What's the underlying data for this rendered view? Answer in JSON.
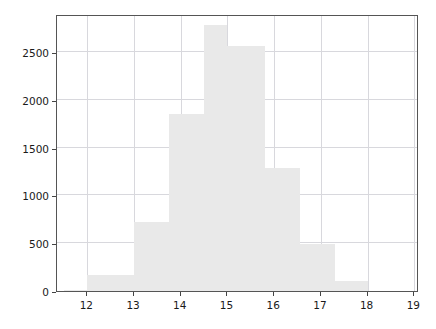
{
  "chart_data": {
    "type": "bar",
    "title": "",
    "xlabel": "",
    "ylabel": "",
    "subtitle": "",
    "grid": true,
    "legend": null,
    "bar_color": "#e9e9e9",
    "axis_color": "#555555",
    "grid_color": "#d8d8dd",
    "histogram": true,
    "bin_width": 0.5,
    "bin_edges": [
      11.5,
      12.0,
      12.5,
      13.0,
      13.5,
      14.0,
      14.5,
      15.0,
      15.5,
      16.0,
      16.5,
      17.0,
      17.5,
      18.0
    ],
    "bin_centers": [
      11.75,
      12.25,
      12.75,
      13.25,
      13.75,
      14.25,
      14.75,
      15.25,
      15.75,
      16.25,
      16.75,
      17.25,
      17.75
    ],
    "values": [
      15,
      165,
      165,
      720,
      720,
      1850,
      2780,
      2570,
      2570,
      1290,
      1290,
      490,
      100
    ],
    "bars": [
      {
        "x0": 11.5,
        "x1": 12.0,
        "value": 15
      },
      {
        "x0": 12.0,
        "x1": 13.0,
        "value": 165
      },
      {
        "x0": 13.0,
        "x1": 13.75,
        "value": 720
      },
      {
        "x0": 13.75,
        "x1": 14.5,
        "value": 1850
      },
      {
        "x0": 14.5,
        "x1": 15.0,
        "value": 2780
      },
      {
        "x0": 15.0,
        "x1": 15.8,
        "value": 2570
      },
      {
        "x0": 15.8,
        "x1": 16.55,
        "value": 1290
      },
      {
        "x0": 16.55,
        "x1": 17.3,
        "value": 490
      },
      {
        "x0": 17.3,
        "x1": 18.0,
        "value": 100
      }
    ],
    "xlim": [
      11.35,
      19.1
    ],
    "ylim": [
      0,
      2900
    ],
    "xticks": [
      12,
      13,
      14,
      15,
      16,
      17,
      18,
      19
    ],
    "xticklabels": [
      "12",
      "13",
      "14",
      "15",
      "16",
      "17",
      "18",
      "19"
    ],
    "yticks": [
      0,
      500,
      1000,
      1500,
      2000,
      2500
    ],
    "yticklabels": [
      "0",
      "500",
      "1000",
      "1500",
      "2000",
      "2500"
    ]
  }
}
